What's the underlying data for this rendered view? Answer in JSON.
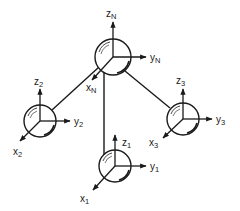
{
  "diagram": {
    "type": "coordinate-frames-network",
    "stroke_color": "#1a1a1a",
    "background": "#ffffff",
    "nodes": [
      {
        "id": "N",
        "cx": 113,
        "cy": 57,
        "r": 18,
        "labels": {
          "z": {
            "main": "z",
            "sub": "N"
          },
          "y": {
            "main": "y",
            "sub": "N"
          },
          "x": {
            "main": "x",
            "sub": "N"
          }
        }
      },
      {
        "id": "2",
        "cx": 40,
        "cy": 121,
        "r": 16,
        "labels": {
          "z": {
            "main": "z",
            "sub": "2"
          },
          "y": {
            "main": "y",
            "sub": "2"
          },
          "x": {
            "main": "x",
            "sub": "2"
          }
        }
      },
      {
        "id": "3",
        "cx": 183,
        "cy": 119,
        "r": 16,
        "labels": {
          "z": {
            "main": "z",
            "sub": "3"
          },
          "y": {
            "main": "y",
            "sub": "3"
          },
          "x": {
            "main": "x",
            "sub": "3"
          }
        }
      },
      {
        "id": "1",
        "cx": 115,
        "cy": 166,
        "r": 16,
        "labels": {
          "z": {
            "main": "z",
            "sub": "1"
          },
          "y": {
            "main": "y",
            "sub": "1"
          },
          "x": {
            "main": "x",
            "sub": "1"
          }
        }
      }
    ],
    "links": [
      {
        "from": "N",
        "to": "2"
      },
      {
        "from": "N",
        "to": "3"
      },
      {
        "from": "N",
        "to": "1"
      }
    ]
  }
}
